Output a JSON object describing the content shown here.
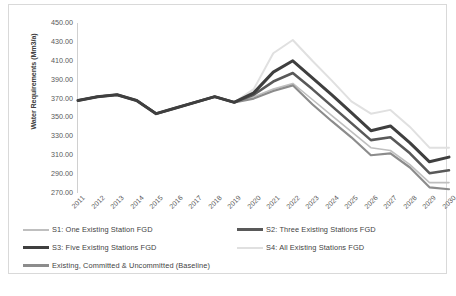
{
  "chart_data": {
    "type": "line",
    "title": "",
    "xlabel": "",
    "ylabel": "Water Requirements (Mm3/a)",
    "ylim": [
      270,
      450
    ],
    "yticks": [
      "270.00",
      "290.00",
      "310.00",
      "330.00",
      "350.00",
      "370.00",
      "390.00",
      "410.00",
      "430.00",
      "450.00"
    ],
    "grid": false,
    "legend_position": "bottom",
    "categories": [
      "2011",
      "2012",
      "2013",
      "2014",
      "2015",
      "2016",
      "2017",
      "2018",
      "2019",
      "2020",
      "2021",
      "2022",
      "2023",
      "2024",
      "2025",
      "2026",
      "2027",
      "2028",
      "2029",
      "2030"
    ],
    "series": [
      {
        "name": "S1: One Existing Station FGD",
        "color": "#bfbfbf",
        "width": 1.6,
        "values": [
          368,
          372,
          374,
          368,
          354,
          360,
          366,
          372,
          366,
          372,
          380,
          386,
          369,
          352,
          335,
          318,
          315,
          300,
          281,
          281
        ]
      },
      {
        "name": "S2: Three Existing Stations FGD",
        "color": "#595959",
        "width": 2.6,
        "values": [
          368,
          372,
          374,
          368,
          354,
          360,
          366,
          372,
          366,
          374,
          388,
          397,
          380,
          362,
          344,
          326,
          329,
          312,
          291,
          294
        ]
      },
      {
        "name": "S3: Five Existing Stations FGD",
        "color": "#3f3f3f",
        "width": 3.0,
        "values": [
          368,
          372,
          374,
          368,
          354,
          360,
          366,
          372,
          366,
          376,
          398,
          410,
          392,
          374,
          355,
          336,
          341,
          323,
          303,
          308
        ]
      },
      {
        "name": "S4: All Existing Stations FGD",
        "color": "#e0e0e0",
        "width": 2.0,
        "values": [
          368,
          372,
          374,
          368,
          354,
          360,
          366,
          372,
          366,
          380,
          418,
          432,
          410,
          389,
          367,
          354,
          358,
          340,
          318,
          318
        ]
      },
      {
        "name": "Existing, Committed & Uncommitted (Baseline)",
        "color": "#8c8c8c",
        "width": 2.2,
        "values": [
          368,
          372,
          374,
          368,
          354,
          360,
          366,
          372,
          366,
          370,
          378,
          384,
          364,
          346,
          329,
          310,
          312,
          297,
          276,
          274
        ]
      }
    ]
  },
  "legend": {
    "items": [
      {
        "label": "S1: One Existing Station  FGD"
      },
      {
        "label": "S2: Three Existing Stations  FGD"
      },
      {
        "label": "S3: Five Existing Stations  FGD"
      },
      {
        "label": "S4: All Existing  Stations  FGD"
      },
      {
        "label": "Existing, Committed & Uncommitted  (Baseline)"
      }
    ]
  }
}
